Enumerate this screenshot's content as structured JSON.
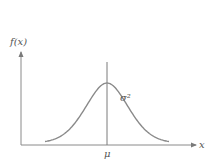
{
  "chart_data": {
    "type": "line",
    "title": "",
    "xlabel": "x",
    "ylabel": "f(x)",
    "xtick_labels": [
      "μ"
    ],
    "annotations": [
      "σ²"
    ],
    "distribution": "normal (bell curve)",
    "series": [
      {
        "name": "f(x)",
        "mean": 0,
        "std": 1,
        "x_range": [
          -2.8,
          2.8
        ],
        "peak_relative_height": 0.65
      }
    ],
    "grid": false,
    "legend": "none",
    "color": "#8a8a8a"
  },
  "labels": {
    "y_axis": "f(x)",
    "x_axis": "x",
    "mean": "μ",
    "variance": "σ²"
  }
}
